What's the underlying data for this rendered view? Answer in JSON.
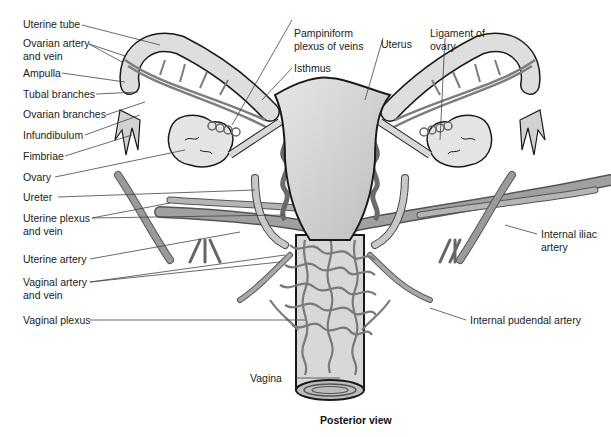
{
  "figure": {
    "caption": "Posterior view",
    "colors": {
      "organ_fill": "#d6d6d6",
      "organ_stroke": "#1a1a1a",
      "vessel": "#8a8a8a",
      "vessel_dark": "#555555",
      "leader_line": "#444444",
      "label_text": "#222222",
      "background": "#ffffff"
    }
  },
  "labels_left": [
    {
      "text": "Uterine tube"
    },
    {
      "text": "Ovarian artery\nand vein"
    },
    {
      "text": "Ampulla"
    },
    {
      "text": "Tubal branches"
    },
    {
      "text": "Ovarian branches"
    },
    {
      "text": "Infundibulum"
    },
    {
      "text": "Fimbriae"
    },
    {
      "text": "Ovary"
    },
    {
      "text": "Ureter"
    },
    {
      "text": "Uterine plexus\nand vein"
    },
    {
      "text": "Uterine artery"
    },
    {
      "text": "Vaginal artery\nand vein"
    },
    {
      "text": "Vaginal plexus"
    }
  ],
  "labels_top": [
    {
      "text": "Pampiniform\nplexus of veins"
    },
    {
      "text": "Isthmus"
    },
    {
      "text": "Uterus"
    },
    {
      "text": "Ligament of\novary"
    }
  ],
  "labels_right": [
    {
      "text": "Internal iliac\nartery"
    },
    {
      "text": "Internal pudendal artery"
    }
  ],
  "labels_bottom": [
    {
      "text": "Vagina"
    }
  ]
}
